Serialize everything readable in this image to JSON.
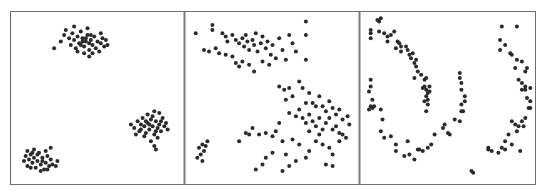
{
  "figure": {
    "background": "#ffffff",
    "frame_color": "#6e6e6e",
    "divider_color": "#7a7a7a",
    "dot_color": "#2a2a2a"
  },
  "chart_data": [
    {
      "type": "scatter",
      "title": "",
      "xlabel": "",
      "ylabel": "",
      "grid": false,
      "legend": null,
      "panel": "left",
      "description": "Three compact Gaussian blobs",
      "xlim": [
        0,
        100
      ],
      "ylim": [
        0,
        100
      ],
      "points": [
        [
          28,
          84
        ],
        [
          30,
          88
        ],
        [
          31,
          91
        ],
        [
          33,
          86
        ],
        [
          34,
          82
        ],
        [
          35,
          89
        ],
        [
          36,
          85
        ],
        [
          37,
          80
        ],
        [
          38,
          87
        ],
        [
          39,
          83
        ],
        [
          40,
          90
        ],
        [
          41,
          86
        ],
        [
          42,
          81
        ],
        [
          43,
          84
        ],
        [
          44,
          88
        ],
        [
          45,
          79
        ],
        [
          46,
          85
        ],
        [
          47,
          82
        ],
        [
          48,
          87
        ],
        [
          49,
          80
        ],
        [
          50,
          84
        ],
        [
          51,
          78
        ],
        [
          52,
          83
        ],
        [
          53,
          86
        ],
        [
          54,
          81
        ],
        [
          55,
          85
        ],
        [
          38,
          78
        ],
        [
          42,
          77
        ],
        [
          45,
          75
        ],
        [
          47,
          77
        ],
        [
          24,
          80
        ],
        [
          52,
          89
        ],
        [
          44,
          92
        ],
        [
          36,
          93
        ],
        [
          56,
          82
        ],
        [
          41,
          84
        ],
        [
          43,
          86
        ],
        [
          45,
          83
        ],
        [
          40,
          82
        ],
        [
          46,
          88
        ],
        [
          70,
          34
        ],
        [
          72,
          32
        ],
        [
          74,
          36
        ],
        [
          75,
          30
        ],
        [
          76,
          34
        ],
        [
          77,
          38
        ],
        [
          78,
          33
        ],
        [
          79,
          29
        ],
        [
          80,
          35
        ],
        [
          81,
          31
        ],
        [
          82,
          37
        ],
        [
          83,
          33
        ],
        [
          84,
          28
        ],
        [
          85,
          36
        ],
        [
          86,
          32
        ],
        [
          87,
          34
        ],
        [
          88,
          30
        ],
        [
          89,
          38
        ],
        [
          90,
          33
        ],
        [
          80,
          40
        ],
        [
          84,
          42
        ],
        [
          86,
          26
        ],
        [
          82,
          24
        ],
        [
          78,
          27
        ],
        [
          73,
          28
        ],
        [
          91,
          35
        ],
        [
          92,
          31
        ],
        [
          88,
          36
        ],
        [
          83,
          39
        ],
        [
          79,
          36
        ],
        [
          76,
          31
        ],
        [
          85,
          30
        ],
        [
          81,
          34
        ],
        [
          87,
          41
        ],
        [
          84,
          21
        ],
        [
          85,
          19
        ],
        [
          6,
          12
        ],
        [
          7,
          15
        ],
        [
          8,
          9
        ],
        [
          9,
          13
        ],
        [
          10,
          16
        ],
        [
          11,
          11
        ],
        [
          12,
          14
        ],
        [
          13,
          8
        ],
        [
          14,
          12
        ],
        [
          15,
          17
        ],
        [
          16,
          10
        ],
        [
          17,
          14
        ],
        [
          18,
          7
        ],
        [
          19,
          11
        ],
        [
          20,
          15
        ],
        [
          21,
          9
        ],
        [
          22,
          13
        ],
        [
          8,
          18
        ],
        [
          12,
          19
        ],
        [
          16,
          6
        ],
        [
          19,
          18
        ],
        [
          23,
          10
        ],
        [
          10,
          8
        ],
        [
          14,
          16
        ],
        [
          17,
          12
        ],
        [
          20,
          7
        ],
        [
          25,
          9
        ],
        [
          26,
          12
        ],
        [
          22,
          20
        ],
        [
          11,
          17
        ]
      ]
    },
    {
      "type": "scatter",
      "title": "",
      "xlabel": "",
      "ylabel": "",
      "grid": false,
      "legend": null,
      "panel": "middle",
      "description": "Blobs of differing variance",
      "xlim": [
        0,
        100
      ],
      "ylim": [
        0,
        100
      ],
      "points": [
        [
          4,
          89
        ],
        [
          14,
          94
        ],
        [
          14,
          91
        ],
        [
          20,
          89
        ],
        [
          22,
          87
        ],
        [
          23,
          84
        ],
        [
          26,
          88
        ],
        [
          28,
          85
        ],
        [
          30,
          83
        ],
        [
          32,
          86
        ],
        [
          33,
          81
        ],
        [
          34,
          88
        ],
        [
          35,
          84
        ],
        [
          36,
          79
        ],
        [
          38,
          85
        ],
        [
          39,
          82
        ],
        [
          40,
          89
        ],
        [
          41,
          78
        ],
        [
          43,
          83
        ],
        [
          44,
          87
        ],
        [
          46,
          80
        ],
        [
          47,
          84
        ],
        [
          49,
          76
        ],
        [
          50,
          82
        ],
        [
          52,
          74
        ],
        [
          54,
          86
        ],
        [
          56,
          79
        ],
        [
          58,
          73
        ],
        [
          60,
          88
        ],
        [
          62,
          83
        ],
        [
          64,
          78
        ],
        [
          70,
          96
        ],
        [
          70,
          88
        ],
        [
          70,
          73
        ],
        [
          9,
          79
        ],
        [
          12,
          78
        ],
        [
          16,
          80
        ],
        [
          18,
          77
        ],
        [
          22,
          76
        ],
        [
          26,
          75
        ],
        [
          32,
          72
        ],
        [
          36,
          70
        ],
        [
          39,
          66
        ],
        [
          44,
          72
        ],
        [
          48,
          70
        ],
        [
          30,
          69
        ],
        [
          28,
          71
        ],
        [
          54,
          57
        ],
        [
          57,
          55
        ],
        [
          60,
          56
        ],
        [
          62,
          51
        ],
        [
          58,
          49
        ],
        [
          66,
          60
        ],
        [
          68,
          56
        ],
        [
          72,
          53
        ],
        [
          70,
          47
        ],
        [
          74,
          47
        ],
        [
          76,
          45
        ],
        [
          78,
          51
        ],
        [
          80,
          45
        ],
        [
          82,
          42
        ],
        [
          84,
          48
        ],
        [
          86,
          44
        ],
        [
          88,
          40
        ],
        [
          90,
          43
        ],
        [
          92,
          37
        ],
        [
          96,
          34
        ],
        [
          95,
          39
        ],
        [
          60,
          41
        ],
        [
          64,
          39
        ],
        [
          66,
          43
        ],
        [
          68,
          38
        ],
        [
          70,
          35
        ],
        [
          72,
          40
        ],
        [
          74,
          36
        ],
        [
          76,
          33
        ],
        [
          78,
          38
        ],
        [
          80,
          31
        ],
        [
          82,
          35
        ],
        [
          84,
          38
        ],
        [
          86,
          31
        ],
        [
          88,
          33
        ],
        [
          90,
          29
        ],
        [
          92,
          28
        ],
        [
          94,
          26
        ],
        [
          76,
          24
        ],
        [
          80,
          22
        ],
        [
          84,
          20
        ],
        [
          90,
          24
        ],
        [
          86,
          16
        ],
        [
          72,
          18
        ],
        [
          70,
          14
        ],
        [
          64,
          12
        ],
        [
          58,
          16
        ],
        [
          50,
          17
        ],
        [
          46,
          14
        ],
        [
          44,
          10
        ],
        [
          40,
          7
        ],
        [
          54,
          35
        ],
        [
          52,
          30
        ],
        [
          50,
          27
        ],
        [
          46,
          29
        ],
        [
          42,
          28
        ],
        [
          38,
          32
        ],
        [
          36,
          28
        ],
        [
          34,
          29
        ],
        [
          30,
          24
        ],
        [
          62,
          25
        ],
        [
          66,
          22
        ],
        [
          72,
          30
        ],
        [
          78,
          28
        ],
        [
          56,
          24
        ],
        [
          82,
          10
        ],
        [
          86,
          9
        ],
        [
          60,
          9
        ],
        [
          56,
          6
        ],
        [
          6,
          20
        ],
        [
          8,
          22
        ],
        [
          9,
          18
        ],
        [
          10,
          21
        ],
        [
          7,
          16
        ],
        [
          11,
          24
        ],
        [
          5,
          14
        ],
        [
          8,
          12
        ]
      ]
    },
    {
      "type": "scatter",
      "title": "",
      "xlabel": "",
      "ylabel": "",
      "grid": false,
      "legend": null,
      "panel": "right",
      "description": "Two interleaving half-moon / crescent shapes",
      "xlim": [
        0,
        100
      ],
      "ylim": [
        0,
        100
      ],
      "points": [
        [
          8,
          97
        ],
        [
          9,
          96
        ],
        [
          10,
          98
        ],
        [
          4,
          91
        ],
        [
          4,
          89
        ],
        [
          4,
          86
        ],
        [
          9,
          90
        ],
        [
          12,
          89
        ],
        [
          14,
          87
        ],
        [
          16,
          88
        ],
        [
          18,
          90
        ],
        [
          14,
          84
        ],
        [
          20,
          84
        ],
        [
          21,
          83
        ],
        [
          22,
          81
        ],
        [
          19,
          80
        ],
        [
          25,
          81
        ],
        [
          22,
          78
        ],
        [
          27,
          76
        ],
        [
          26,
          79
        ],
        [
          28,
          74
        ],
        [
          29,
          77
        ],
        [
          30,
          71
        ],
        [
          31,
          73
        ],
        [
          31,
          69
        ],
        [
          32,
          66
        ],
        [
          30,
          62
        ],
        [
          34,
          64
        ],
        [
          36,
          61
        ],
        [
          37,
          62
        ],
        [
          36,
          57
        ],
        [
          35,
          56
        ],
        [
          37,
          55
        ],
        [
          38,
          53
        ],
        [
          39,
          54
        ],
        [
          37,
          51
        ],
        [
          38,
          49
        ],
        [
          36,
          48
        ],
        [
          38,
          46
        ],
        [
          37,
          42
        ],
        [
          39,
          57
        ],
        [
          4,
          61
        ],
        [
          4,
          57
        ],
        [
          3,
          54
        ],
        [
          5,
          49
        ],
        [
          4,
          45
        ],
        [
          3,
          43
        ],
        [
          5,
          44
        ],
        [
          6,
          45
        ],
        [
          10,
          43
        ],
        [
          11,
          37
        ],
        [
          10,
          30
        ],
        [
          12,
          26
        ],
        [
          16,
          27
        ],
        [
          19,
          22
        ],
        [
          19,
          18
        ],
        [
          26,
          24
        ],
        [
          24,
          15
        ],
        [
          27,
          16
        ],
        [
          30,
          13
        ],
        [
          32,
          19
        ],
        [
          33,
          19
        ],
        [
          35,
          18
        ],
        [
          38,
          20
        ],
        [
          40,
          22
        ],
        [
          42,
          28
        ],
        [
          47,
          32
        ],
        [
          48,
          34
        ],
        [
          50,
          29
        ],
        [
          51,
          28
        ],
        [
          54,
          37
        ],
        [
          57,
          36
        ],
        [
          58,
          42
        ],
        [
          59,
          42
        ],
        [
          58,
          46
        ],
        [
          60,
          48
        ],
        [
          60,
          51
        ],
        [
          58,
          55
        ],
        [
          58,
          59
        ],
        [
          57,
          62
        ],
        [
          57,
          65
        ],
        [
          82,
          93
        ],
        [
          91,
          93
        ],
        [
          81,
          85
        ],
        [
          84,
          82
        ],
        [
          81,
          79
        ],
        [
          87,
          77
        ],
        [
          88,
          76
        ],
        [
          91,
          73
        ],
        [
          94,
          72
        ],
        [
          97,
          68
        ],
        [
          96,
          66
        ],
        [
          90,
          68
        ],
        [
          92,
          61
        ],
        [
          94,
          59
        ],
        [
          96,
          57
        ],
        [
          96,
          55
        ],
        [
          99,
          56
        ],
        [
          94,
          55
        ],
        [
          97,
          50
        ],
        [
          99,
          48
        ],
        [
          99,
          44
        ],
        [
          98,
          44
        ],
        [
          96,
          38
        ],
        [
          94,
          36
        ],
        [
          92,
          33
        ],
        [
          90,
          34
        ],
        [
          88,
          36
        ],
        [
          95,
          33
        ],
        [
          91,
          30
        ],
        [
          86,
          28
        ],
        [
          88,
          22
        ],
        [
          84,
          24
        ],
        [
          82,
          20
        ],
        [
          84,
          19
        ],
        [
          80,
          17
        ],
        [
          76,
          18
        ],
        [
          74,
          19
        ],
        [
          74,
          20
        ],
        [
          93,
          18
        ],
        [
          64,
          6
        ],
        [
          65,
          5
        ]
      ]
    }
  ]
}
